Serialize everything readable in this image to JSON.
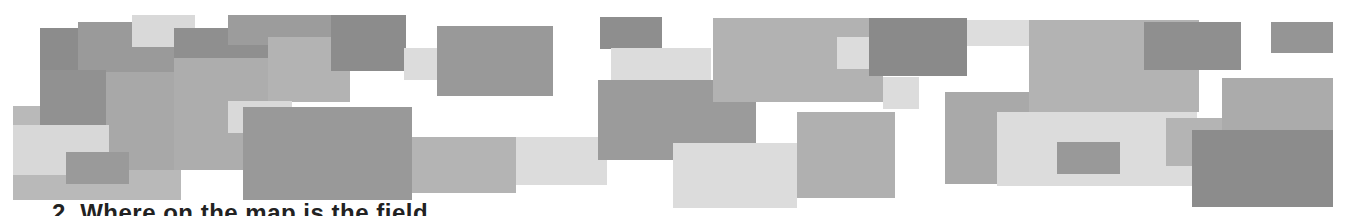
{
  "figure": {
    "rectangles": [
      {
        "x": 13,
        "y": 106,
        "w": 168,
        "h": 94,
        "color": "#b9b9b9"
      },
      {
        "x": 40,
        "y": 28,
        "w": 66,
        "h": 97,
        "color": "#8c8c8c"
      },
      {
        "x": 78,
        "y": 22,
        "w": 96,
        "h": 50,
        "color": "#9a9a9a"
      },
      {
        "x": 132,
        "y": 15,
        "w": 63,
        "h": 32,
        "color": "#d9d9d9"
      },
      {
        "x": 174,
        "y": 28,
        "w": 120,
        "h": 30,
        "color": "#8f8f8f"
      },
      {
        "x": 228,
        "y": 15,
        "w": 104,
        "h": 30,
        "color": "#9c9c9c"
      },
      {
        "x": 40,
        "y": 70,
        "w": 66,
        "h": 55,
        "color": "#919191"
      },
      {
        "x": 106,
        "y": 72,
        "w": 136,
        "h": 98,
        "color": "#a8a8a8"
      },
      {
        "x": 174,
        "y": 58,
        "w": 94,
        "h": 112,
        "color": "#adadad"
      },
      {
        "x": 268,
        "y": 37,
        "w": 82,
        "h": 65,
        "color": "#b3b3b3"
      },
      {
        "x": 13,
        "y": 125,
        "w": 96,
        "h": 50,
        "color": "#d8d8d8"
      },
      {
        "x": 66,
        "y": 152,
        "w": 63,
        "h": 32,
        "color": "#9a9a9a"
      },
      {
        "x": 228,
        "y": 101,
        "w": 64,
        "h": 32,
        "color": "#d9d9d9"
      },
      {
        "x": 243,
        "y": 107,
        "w": 169,
        "h": 93,
        "color": "#999999"
      },
      {
        "x": 331,
        "y": 15,
        "w": 75,
        "h": 56,
        "color": "#8c8c8c"
      },
      {
        "x": 404,
        "y": 48,
        "w": 62,
        "h": 32,
        "color": "#dcdcdc"
      },
      {
        "x": 437,
        "y": 26,
        "w": 116,
        "h": 70,
        "color": "#999999"
      },
      {
        "x": 412,
        "y": 137,
        "w": 104,
        "h": 56,
        "color": "#b4b4b4"
      },
      {
        "x": 516,
        "y": 137,
        "w": 91,
        "h": 48,
        "color": "#dcdcdc"
      },
      {
        "x": 600,
        "y": 17,
        "w": 62,
        "h": 32,
        "color": "#8e8e8e"
      },
      {
        "x": 611,
        "y": 48,
        "w": 100,
        "h": 32,
        "color": "#dcdcdc"
      },
      {
        "x": 598,
        "y": 80,
        "w": 158,
        "h": 80,
        "color": "#9b9b9b"
      },
      {
        "x": 713,
        "y": 18,
        "w": 170,
        "h": 84,
        "color": "#b2b2b2"
      },
      {
        "x": 837,
        "y": 37,
        "w": 62,
        "h": 32,
        "color": "#dcdcdc"
      },
      {
        "x": 869,
        "y": 18,
        "w": 98,
        "h": 58,
        "color": "#8a8a8a"
      },
      {
        "x": 883,
        "y": 77,
        "w": 36,
        "h": 32,
        "color": "#dcdcdc"
      },
      {
        "x": 673,
        "y": 143,
        "w": 124,
        "h": 65,
        "color": "#dcdcdc"
      },
      {
        "x": 797,
        "y": 112,
        "w": 98,
        "h": 86,
        "color": "#b0b0b0"
      },
      {
        "x": 945,
        "y": 92,
        "w": 122,
        "h": 92,
        "color": "#a9a9a9"
      },
      {
        "x": 967,
        "y": 20,
        "w": 62,
        "h": 26,
        "color": "#dddddd"
      },
      {
        "x": 1029,
        "y": 20,
        "w": 170,
        "h": 92,
        "color": "#b3b3b3"
      },
      {
        "x": 1144,
        "y": 22,
        "w": 97,
        "h": 48,
        "color": "#8f8f8f"
      },
      {
        "x": 1271,
        "y": 22,
        "w": 62,
        "h": 31,
        "color": "#959595"
      },
      {
        "x": 997,
        "y": 112,
        "w": 200,
        "h": 74,
        "color": "#dcdcdc"
      },
      {
        "x": 1057,
        "y": 142,
        "w": 63,
        "h": 32,
        "color": "#999999"
      },
      {
        "x": 1166,
        "y": 118,
        "w": 64,
        "h": 48,
        "color": "#b4b4b4"
      },
      {
        "x": 1222,
        "y": 78,
        "w": 111,
        "h": 52,
        "color": "#ababab"
      },
      {
        "x": 1192,
        "y": 130,
        "w": 141,
        "h": 77,
        "color": "#8c8c8c"
      }
    ]
  },
  "question": {
    "number": "2.",
    "text": "2. Where on the map is the field ..."
  }
}
